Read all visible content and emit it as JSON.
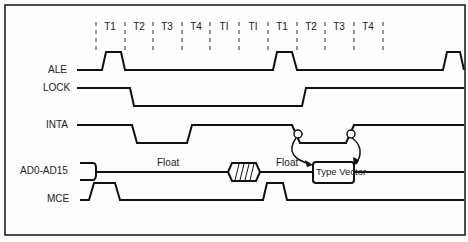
{
  "diagram": {
    "type": "timing-diagram",
    "clock_states": [
      "T1",
      "T2",
      "T3",
      "T4",
      "TI",
      "TI",
      "T1",
      "T2",
      "T3",
      "T4"
    ],
    "signals": [
      {
        "name": "ALE"
      },
      {
        "name": "LOCK"
      },
      {
        "name": "INTA"
      },
      {
        "name": "AD0-AD15"
      },
      {
        "name": "MCE"
      }
    ],
    "annotations": {
      "float_1": "Float",
      "float_2": "Float",
      "type_vector": "Type Vector"
    },
    "colors": {
      "line": "#111111",
      "background": "#fdfdfd"
    }
  }
}
